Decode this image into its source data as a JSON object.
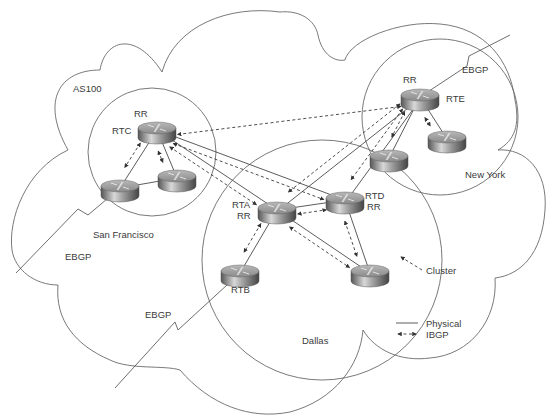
{
  "diagram": {
    "autonomous_system": "AS100",
    "clusters": [
      {
        "id": "sf",
        "name": "San Francisco"
      },
      {
        "id": "ny",
        "name": "New York"
      },
      {
        "id": "dallas",
        "name": "Dallas"
      }
    ],
    "routers": [
      {
        "id": "sf_rr",
        "labels": [
          "RR",
          "RTC"
        ],
        "cluster": "sf"
      },
      {
        "id": "sf_c1",
        "labels": [],
        "cluster": "sf"
      },
      {
        "id": "sf_c2",
        "labels": [],
        "cluster": "sf"
      },
      {
        "id": "rta",
        "labels": [
          "RTA",
          "RR"
        ],
        "cluster": "dallas"
      },
      {
        "id": "rtd",
        "labels": [
          "RTD",
          "RR"
        ],
        "cluster": "dallas"
      },
      {
        "id": "rtb",
        "labels": [
          "RTB"
        ],
        "cluster": "dallas"
      },
      {
        "id": "dal_c",
        "labels": [],
        "cluster": "dallas"
      },
      {
        "id": "ny_rr",
        "labels": [
          "RR",
          "RTE"
        ],
        "cluster": "ny"
      },
      {
        "id": "ny_c1",
        "labels": [],
        "cluster": "ny"
      },
      {
        "id": "ny_c2",
        "labels": [],
        "cluster": "ny"
      }
    ],
    "physical_links": [
      [
        "sf_rr",
        "sf_c1"
      ],
      [
        "sf_rr",
        "sf_c2"
      ],
      [
        "sf_c1",
        "sf_c2"
      ],
      [
        "sf_rr",
        "rta"
      ],
      [
        "sf_rr",
        "rtd"
      ],
      [
        "rta",
        "rtd"
      ],
      [
        "rta",
        "rtb"
      ],
      [
        "rta",
        "dal_c"
      ],
      [
        "rtd",
        "dal_c"
      ],
      [
        "ny_rr",
        "rta"
      ],
      [
        "ny_rr",
        "rtd"
      ],
      [
        "ny_rr",
        "ny_c1"
      ],
      [
        "ny_rr",
        "ny_c2"
      ]
    ],
    "ibgp_sessions": [
      [
        "sf_rr",
        "sf_c1"
      ],
      [
        "sf_rr",
        "sf_c2"
      ],
      [
        "sf_rr",
        "rta"
      ],
      [
        "sf_rr",
        "rtd"
      ],
      [
        "sf_rr",
        "ny_rr"
      ],
      [
        "rta",
        "rtd"
      ],
      [
        "rta",
        "rtb"
      ],
      [
        "rta",
        "dal_c"
      ],
      [
        "rtd",
        "dal_c"
      ],
      [
        "ny_rr",
        "rta"
      ],
      [
        "ny_rr",
        "rtd"
      ],
      [
        "ny_rr",
        "ny_c1"
      ],
      [
        "ny_rr",
        "ny_c2"
      ]
    ],
    "ebgp_links": [
      {
        "from": "sf_c1",
        "label": "EBGP"
      },
      {
        "from": "rtb",
        "label": "EBGP"
      },
      {
        "from": "ny_rr",
        "label": "EBGP"
      }
    ],
    "annotations": {
      "cluster_pointer": "Cluster"
    },
    "legend": {
      "physical": "Physical",
      "ibgp": "IBGP"
    }
  }
}
